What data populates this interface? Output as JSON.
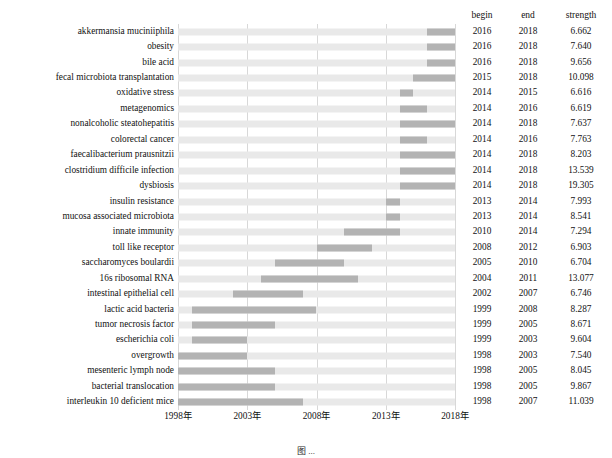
{
  "table_headers": {
    "label": "",
    "begin": "begin",
    "end": "end",
    "strength": "strength"
  },
  "axis": {
    "ticks": [
      "1998年",
      "2003年",
      "2008年",
      "2013年",
      "2018年"
    ],
    "tick_values": [
      1998,
      2003,
      2008,
      2013,
      2018
    ],
    "min": 1998,
    "max": 2018
  },
  "caption": "图 ...",
  "colors": {
    "bar_base": "#e9e9e9",
    "bar_burst": "#b3b3b3",
    "gridline": "#d8d8d8",
    "text": "#111111"
  },
  "chart_data": {
    "type": "bar",
    "title": "",
    "subtitle": "",
    "xlabel": "",
    "ylabel": "",
    "xlim": [
      1998,
      2018
    ],
    "grid": true,
    "legend": "none",
    "columns": [
      "keyword",
      "begin",
      "end",
      "strength"
    ],
    "categories": [
      "akkermansia muciniiphila",
      "obesity",
      "bile acid",
      "fecal microbiota transplantation",
      "oxidative stress",
      "metagenomics",
      "nonalcoholic steatohepatitis",
      "colorectal cancer",
      "faecalibacterium prausnitzii",
      "clostridium difficile infection",
      "dysbiosis",
      "insulin resistance",
      "mucosa associated microbiota",
      "innate immunity",
      "toll like receptor",
      "saccharomyces boulardii",
      "16s ribosomal RNA",
      "intestinal epithelial cell",
      "lactic acid bacteria",
      "tumor necrosis factor",
      "escherichia coli",
      "overgrowth",
      "mesenteric lymph node",
      "bacterial translocation",
      "interleukin 10 deficient mice"
    ],
    "rows": [
      {
        "keyword": "akkermansia muciniiphila",
        "begin": "2016",
        "end": "2018",
        "strength": "6.662",
        "begin_val": 2016,
        "end_val": 2018,
        "strength_val": 6.662
      },
      {
        "keyword": "obesity",
        "begin": "2016",
        "end": "2018",
        "strength": "7.640",
        "begin_val": 2016,
        "end_val": 2018,
        "strength_val": 7.64
      },
      {
        "keyword": "bile acid",
        "begin": "2016",
        "end": "2018",
        "strength": "9.656",
        "begin_val": 2016,
        "end_val": 2018,
        "strength_val": 9.656
      },
      {
        "keyword": "fecal microbiota transplantation",
        "begin": "2015",
        "end": "2018",
        "strength": "10.098",
        "begin_val": 2015,
        "end_val": 2018,
        "strength_val": 10.098
      },
      {
        "keyword": "oxidative stress",
        "begin": "2014",
        "end": "2015",
        "strength": "6.616",
        "begin_val": 2014,
        "end_val": 2015,
        "strength_val": 6.616
      },
      {
        "keyword": "metagenomics",
        "begin": "2014",
        "end": "2016",
        "strength": "6.619",
        "begin_val": 2014,
        "end_val": 2016,
        "strength_val": 6.619
      },
      {
        "keyword": "nonalcoholic steatohepatitis",
        "begin": "2014",
        "end": "2018",
        "strength": "7.637",
        "begin_val": 2014,
        "end_val": 2018,
        "strength_val": 7.637
      },
      {
        "keyword": "colorectal cancer",
        "begin": "2014",
        "end": "2016",
        "strength": "7.763",
        "begin_val": 2014,
        "end_val": 2016,
        "strength_val": 7.763
      },
      {
        "keyword": "faecalibacterium prausnitzii",
        "begin": "2014",
        "end": "2018",
        "strength": "8.203",
        "begin_val": 2014,
        "end_val": 2018,
        "strength_val": 8.203
      },
      {
        "keyword": "clostridium difficile infection",
        "begin": "2014",
        "end": "2018",
        "strength": "13.539",
        "begin_val": 2014,
        "end_val": 2018,
        "strength_val": 13.539
      },
      {
        "keyword": "dysbiosis",
        "begin": "2014",
        "end": "2018",
        "strength": "19.305",
        "begin_val": 2014,
        "end_val": 2018,
        "strength_val": 19.305
      },
      {
        "keyword": "insulin resistance",
        "begin": "2013",
        "end": "2014",
        "strength": "7.993",
        "begin_val": 2013,
        "end_val": 2014,
        "strength_val": 7.993
      },
      {
        "keyword": "mucosa associated microbiota",
        "begin": "2013",
        "end": "2014",
        "strength": "8.541",
        "begin_val": 2013,
        "end_val": 2014,
        "strength_val": 8.541
      },
      {
        "keyword": "innate immunity",
        "begin": "2010",
        "end": "2014",
        "strength": "7.294",
        "begin_val": 2010,
        "end_val": 2014,
        "strength_val": 7.294
      },
      {
        "keyword": "toll like receptor",
        "begin": "2008",
        "end": "2012",
        "strength": "6.903",
        "begin_val": 2008,
        "end_val": 2012,
        "strength_val": 6.903
      },
      {
        "keyword": "saccharomyces boulardii",
        "begin": "2005",
        "end": "2010",
        "strength": "6.704",
        "begin_val": 2005,
        "end_val": 2010,
        "strength_val": 6.704
      },
      {
        "keyword": "16s ribosomal RNA",
        "begin": "2004",
        "end": "2011",
        "strength": "13.077",
        "begin_val": 2004,
        "end_val": 2011,
        "strength_val": 13.077
      },
      {
        "keyword": "intestinal epithelial cell",
        "begin": "2002",
        "end": "2007",
        "strength": "6.746",
        "begin_val": 2002,
        "end_val": 2007,
        "strength_val": 6.746
      },
      {
        "keyword": "lactic acid bacteria",
        "begin": "1999",
        "end": "2008",
        "strength": "8.287",
        "begin_val": 1999,
        "end_val": 2008,
        "strength_val": 8.287
      },
      {
        "keyword": "tumor necrosis factor",
        "begin": "1999",
        "end": "2005",
        "strength": "8.671",
        "begin_val": 1999,
        "end_val": 2005,
        "strength_val": 8.671
      },
      {
        "keyword": "escherichia coli",
        "begin": "1999",
        "end": "2003",
        "strength": "9.604",
        "begin_val": 1999,
        "end_val": 2003,
        "strength_val": 9.604
      },
      {
        "keyword": "overgrowth",
        "begin": "1998",
        "end": "2003",
        "strength": "7.540",
        "begin_val": 1998,
        "end_val": 2003,
        "strength_val": 7.54
      },
      {
        "keyword": "mesenteric lymph node",
        "begin": "1998",
        "end": "2005",
        "strength": "8.045",
        "begin_val": 1998,
        "end_val": 2005,
        "strength_val": 8.045
      },
      {
        "keyword": "bacterial translocation",
        "begin": "1998",
        "end": "2005",
        "strength": "9.867",
        "begin_val": 1998,
        "end_val": 2005,
        "strength_val": 9.867
      },
      {
        "keyword": "interleukin 10 deficient mice",
        "begin": "1998",
        "end": "2007",
        "strength": "11.039",
        "begin_val": 1998,
        "end_val": 2007,
        "strength_val": 11.039
      }
    ]
  }
}
